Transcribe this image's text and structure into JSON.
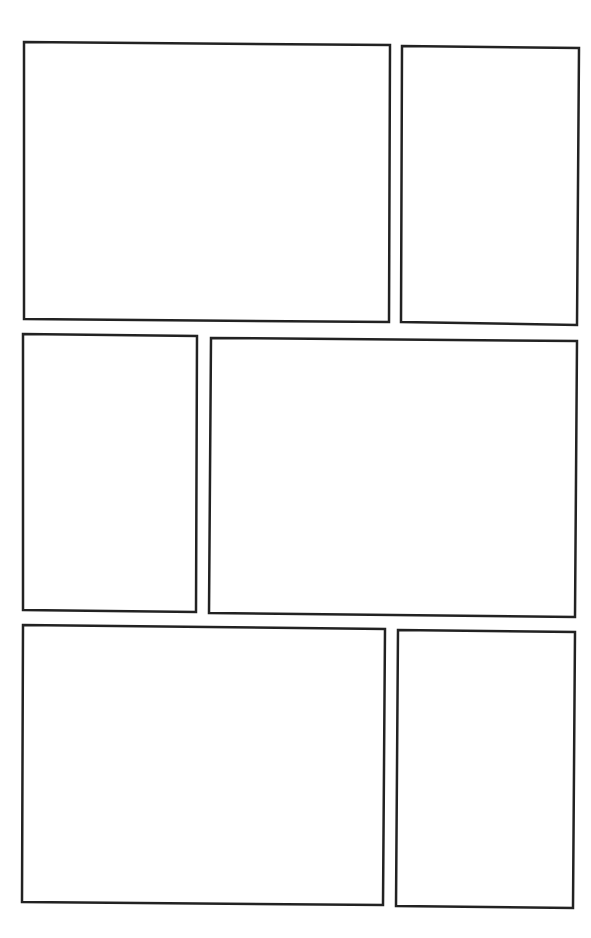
{
  "page": {
    "type": "comic-page-layout",
    "background": "#ffffff",
    "border_color": "#222222",
    "panel_count": 6,
    "panels": [
      {
        "id": 1,
        "points": "24,42 390,45 389,322 24,319"
      },
      {
        "id": 2,
        "points": "402,46 579,48 577,325 401,322"
      },
      {
        "id": 3,
        "points": "23,334 197,336 196,612 23,610"
      },
      {
        "id": 4,
        "points": "211,338 577,341 575,617 209,613"
      },
      {
        "id": 5,
        "points": "23,625 385,629 383,905 22,902"
      },
      {
        "id": 6,
        "points": "398,630 575,632 573,908 396,906"
      }
    ]
  }
}
